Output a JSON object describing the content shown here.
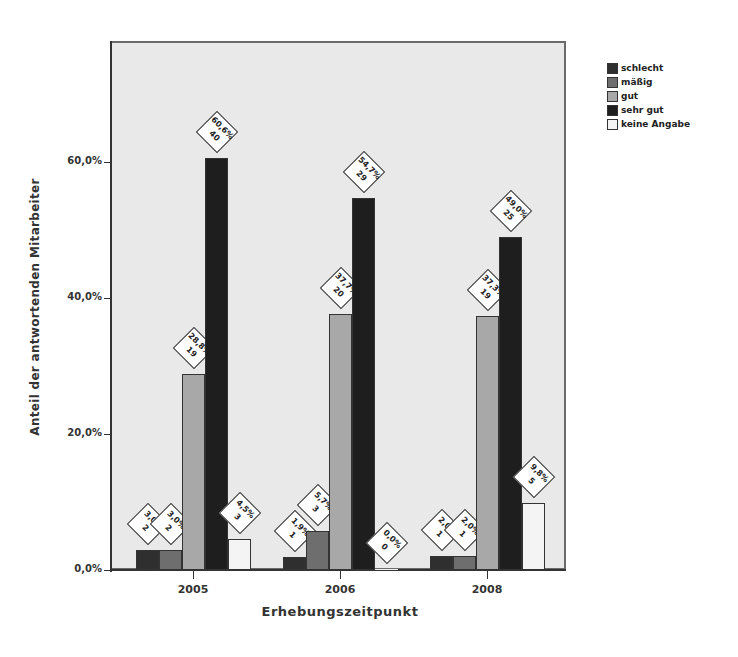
{
  "chart_data": {
    "type": "bar",
    "title": "",
    "xlabel": "Erhebungszeitpunkt",
    "ylabel": "Anteil der antwortenden Mitarbeiter",
    "categories": [
      "2005",
      "2006",
      "2008"
    ],
    "ylim": [
      0,
      77
    ],
    "yticks": [
      "0,0%",
      "20,0%",
      "40,0%",
      "60,0%"
    ],
    "ytick_values": [
      0,
      20,
      40,
      60
    ],
    "grid": false,
    "legend_position": "right",
    "series": [
      {
        "name": "schlecht",
        "color": "#2f2f2f",
        "values": [
          3.0,
          1.9,
          2.0
        ],
        "counts": [
          2,
          1,
          1
        ],
        "labels": [
          "3,0%",
          "1,9%",
          "2,0%"
        ]
      },
      {
        "name": "mäßig",
        "color": "#6e6e6e",
        "values": [
          3.0,
          5.7,
          2.0
        ],
        "counts": [
          2,
          3,
          1
        ],
        "labels": [
          "3,0%",
          "5,7%",
          "2,0%"
        ]
      },
      {
        "name": "gut",
        "color": "#a8a8a8",
        "values": [
          28.8,
          37.7,
          37.3
        ],
        "counts": [
          19,
          20,
          19
        ],
        "labels": [
          "28,8%",
          "37,7%",
          "37,3%"
        ]
      },
      {
        "name": "sehr gut",
        "color": "#1e1e1e",
        "values": [
          60.6,
          54.7,
          49.0
        ],
        "counts": [
          40,
          29,
          25
        ],
        "labels": [
          "60,6%",
          "54,7%",
          "49,0%"
        ]
      },
      {
        "name": "keine Angabe",
        "color": "#f4f4f4",
        "values": [
          4.5,
          0.0,
          9.8
        ],
        "counts": [
          3,
          0,
          5
        ],
        "labels": [
          "4,5%",
          "0,0%",
          "9,8%"
        ]
      }
    ]
  },
  "legend": {
    "items": [
      {
        "label": "schlecht",
        "color": "#2f2f2f"
      },
      {
        "label": "mäßig",
        "color": "#6e6e6e"
      },
      {
        "label": "gut",
        "color": "#a8a8a8"
      },
      {
        "label": "sehr gut",
        "color": "#1e1e1e"
      },
      {
        "label": "keine Angabe",
        "color": "#f4f4f4"
      }
    ]
  },
  "axes": {
    "x_title": "Erhebungszeitpunkt",
    "y_title": "Anteil der antwortenden Mitarbeiter",
    "x_ticks": [
      "2005",
      "2006",
      "2008"
    ],
    "y_ticks": [
      "0,0%",
      "20,0%",
      "40,0%",
      "60,0%"
    ]
  }
}
